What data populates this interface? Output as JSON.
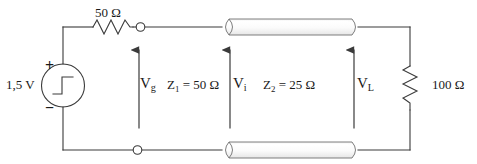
{
  "diagram": {
    "stroke_color": "#3a3a3a",
    "text_color": "#1a1a1a",
    "background": "#ffffff"
  },
  "source": {
    "value": "1,5 V",
    "plus_sign": "+",
    "minus_sign": "−",
    "symbol": "step-function"
  },
  "components": {
    "series_resistor": "50 Ω",
    "load_resistor": "100 Ω"
  },
  "voltages": {
    "generator": {
      "base": "V",
      "sub": "g"
    },
    "input": {
      "base": "V",
      "sub": "i"
    },
    "load": {
      "base": "V",
      "sub": "L"
    }
  },
  "lines": {
    "first": {
      "base": "Z",
      "sub": "1",
      "equals": " = 50 Ω"
    },
    "second": {
      "base": "Z",
      "sub": "2",
      "equals": " = 25 Ω"
    }
  },
  "nodes": {
    "terminal_top": "open-terminal",
    "terminal_bottom": "open-terminal"
  }
}
